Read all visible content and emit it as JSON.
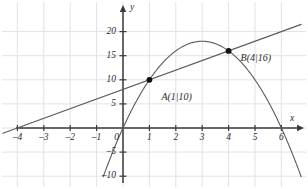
{
  "chart_data": {
    "type": "line",
    "title": "",
    "xlabel": "x",
    "ylabel": "y",
    "xlim": [
      -4.6,
      6.8
    ],
    "ylim": [
      -11.5,
      22.5
    ],
    "grid": true,
    "legend": "none",
    "xticks": [
      -4,
      -3,
      -2,
      -1,
      0,
      1,
      2,
      3,
      4,
      5,
      6
    ],
    "xtick_labels": [
      "–4",
      "–3",
      "–2",
      "–1",
      "0",
      "1",
      "2",
      "3",
      "4",
      "5",
      "6"
    ],
    "yticks": [
      -10,
      -5,
      5,
      10,
      15,
      20
    ],
    "ytick_labels": [
      "–10",
      "–5",
      "5",
      "10",
      "15",
      "20"
    ],
    "series": [
      {
        "name": "parabola",
        "type": "curve",
        "equation": "y = -2x^2 + 12x",
        "color": "#5a5a5a",
        "x": [
          -0.75,
          -0.5,
          0,
          0.5,
          1,
          1.5,
          2,
          2.5,
          3,
          3.5,
          4,
          4.5,
          5,
          5.5,
          6,
          6.5,
          6.75
        ],
        "values": [
          -10.125,
          -6.5,
          0,
          5.5,
          10,
          13.5,
          16,
          17.5,
          18,
          17.5,
          16,
          13.5,
          10,
          5.5,
          0,
          -6.5,
          -10.125
        ]
      },
      {
        "name": "secant-line",
        "type": "line",
        "equation": "y = 2x + 8",
        "color": "#5a5a5a",
        "x": [
          -4.55,
          6.75
        ],
        "values": [
          -1.1,
          21.5
        ]
      }
    ],
    "points": [
      {
        "name": "A",
        "label": "A(1|10)",
        "x": 1,
        "y": 10,
        "label_dx": 12,
        "label_dy": 12
      },
      {
        "name": "B",
        "label": "B(4|16)",
        "x": 4,
        "y": 16,
        "label_dx": 12,
        "label_dy": 2
      }
    ],
    "annotations": []
  },
  "axes": {
    "x_axis_label": "x",
    "y_axis_label": "y",
    "origin_label": "0"
  },
  "colors": {
    "grid": "#e2e2e6",
    "axis": "#3a3a3a",
    "curve": "#5a5a5a",
    "point": "#101010",
    "text": "#2b2b2b",
    "background": "#ffffff"
  }
}
